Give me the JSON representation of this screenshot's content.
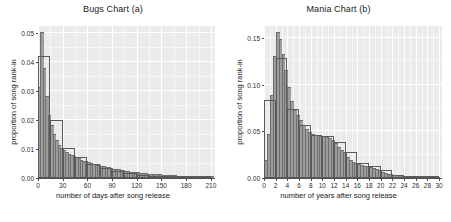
{
  "figure": {
    "background": "#ffffff",
    "panel_background": "#ebebeb",
    "gridline_color": "#ffffff",
    "bar_fill": "#9c9c9c",
    "bar_outline": "#5a5a5a"
  },
  "chart_data": [
    {
      "type": "bar",
      "id": "bugs",
      "title": "Bugs Chart (a)",
      "xlabel": "number of days after song release",
      "ylabel": "proportion of song rank-in",
      "xlim": [
        0,
        215
      ],
      "ylim": [
        0,
        0.0525
      ],
      "xticks": [
        0,
        30,
        60,
        90,
        120,
        150,
        180,
        210
      ],
      "xticklabels": [
        "0",
        "30",
        "60",
        "90",
        "120",
        "150",
        "180",
        "210"
      ],
      "yticks": [
        0.0,
        0.01,
        0.02,
        0.03,
        0.04,
        0.05
      ],
      "yticklabels": [
        "0.00",
        "0.01",
        "0.02",
        "0.03",
        "0.04",
        "0.05"
      ],
      "grid": true,
      "legend": "none",
      "series": [
        {
          "name": "fine-bin histogram",
          "style": "filled",
          "bin_width": 3,
          "bin_starts": [
            0,
            3,
            6,
            9,
            12,
            15,
            18,
            21,
            24,
            27,
            30,
            33,
            36,
            39,
            42,
            45,
            48,
            51,
            54,
            57,
            60,
            63,
            66,
            69,
            72,
            75,
            78,
            81,
            84,
            87,
            90,
            93,
            96,
            99,
            102,
            105,
            108,
            111,
            114,
            117,
            120,
            123,
            126,
            129,
            132,
            135,
            138,
            141,
            144,
            147,
            150,
            153,
            156,
            159,
            162,
            165,
            168,
            171,
            174,
            177,
            180,
            183,
            186,
            189,
            192,
            195,
            198,
            201,
            204,
            207,
            210
          ],
          "values": [
            0.031,
            0.05,
            0.0375,
            0.028,
            0.0215,
            0.018,
            0.015,
            0.0128,
            0.0112,
            0.01,
            0.0092,
            0.0086,
            0.0081,
            0.0076,
            0.0072,
            0.0068,
            0.0064,
            0.006,
            0.0057,
            0.0054,
            0.0051,
            0.0048,
            0.0046,
            0.0043,
            0.0041,
            0.0039,
            0.0037,
            0.0035,
            0.0033,
            0.0031,
            0.0029,
            0.0028,
            0.0026,
            0.0025,
            0.0023,
            0.0022,
            0.0021,
            0.0019,
            0.0018,
            0.0017,
            0.0016,
            0.0015,
            0.0014,
            0.0013,
            0.0012,
            0.0011,
            0.0011,
            0.001,
            0.0009,
            0.0009,
            0.0008,
            0.0008,
            0.0007,
            0.0007,
            0.0006,
            0.0006,
            0.0005,
            0.0005,
            0.0005,
            0.0004,
            0.0004,
            0.0004,
            0.0003,
            0.0003,
            0.0003,
            0.0003,
            0.0002,
            0.0002,
            0.0002,
            0.0002,
            0.0002
          ]
        },
        {
          "name": "wide-bin histogram outline",
          "style": "outline",
          "bin_width": 15,
          "bin_starts": [
            0,
            15,
            30,
            45,
            60,
            75,
            90,
            105,
            120,
            135,
            150,
            165,
            180,
            195
          ],
          "values": [
            0.042,
            0.02,
            0.0105,
            0.0072,
            0.005,
            0.0035,
            0.0024,
            0.0016,
            0.0011,
            0.0008,
            0.0006,
            0.0004,
            0.0003,
            0.0002
          ]
        }
      ]
    },
    {
      "type": "bar",
      "id": "mania",
      "title": "Mania Chart (b)",
      "xlabel": "number of years after song release",
      "ylabel": "proportion of song rank-in",
      "xlim": [
        0,
        30.5
      ],
      "ylim": [
        0,
        0.163
      ],
      "xticks": [
        0,
        2,
        4,
        6,
        8,
        10,
        12,
        14,
        16,
        18,
        20,
        22,
        24,
        26,
        28,
        30
      ],
      "xticklabels": [
        "0",
        "2",
        "4",
        "6",
        "8",
        "10",
        "12",
        "14",
        "16",
        "18",
        "20",
        "22",
        "24",
        "26",
        "28",
        "30"
      ],
      "yticks": [
        0.0,
        0.05,
        0.1,
        0.15
      ],
      "yticklabels": [
        "0.00",
        "0.05",
        "0.10",
        "0.15"
      ],
      "grid": true,
      "legend": "none",
      "series": [
        {
          "name": "fine-bin histogram",
          "style": "filled",
          "bin_width": 0.5,
          "bin_starts": [
            0,
            0.5,
            1,
            1.5,
            2,
            2.5,
            3,
            3.5,
            4,
            4.5,
            5,
            5.5,
            6,
            6.5,
            7,
            7.5,
            8,
            8.5,
            9,
            9.5,
            10,
            10.5,
            11,
            11.5,
            12,
            12.5,
            13,
            13.5,
            14,
            14.5,
            15,
            15.5,
            16,
            16.5,
            17,
            17.5,
            18,
            18.5,
            19,
            19.5,
            20,
            20.5,
            21,
            21.5,
            22,
            22.5,
            23,
            23.5,
            24,
            24.5,
            25,
            25.5,
            26,
            26.5,
            27,
            27.5,
            28,
            28.5,
            29,
            29.5
          ],
          "values": [
            0.018,
            0.046,
            0.088,
            0.13,
            0.156,
            0.148,
            0.132,
            0.115,
            0.096,
            0.081,
            0.072,
            0.066,
            0.061,
            0.056,
            0.051,
            0.048,
            0.046,
            0.045,
            0.0448,
            0.0445,
            0.044,
            0.043,
            0.0415,
            0.0395,
            0.036,
            0.0325,
            0.0295,
            0.027,
            0.0215,
            0.0185,
            0.0165,
            0.015,
            0.014,
            0.013,
            0.0122,
            0.0115,
            0.0108,
            0.01,
            0.0085,
            0.007,
            0.0055,
            0.0042,
            0.0034,
            0.0028,
            0.0024,
            0.0021,
            0.0018,
            0.0016,
            0.0014,
            0.0012,
            0.001,
            0.0009,
            0.0008,
            0.0007,
            0.0006,
            0.0005,
            0.0004,
            0.0004,
            0.0003,
            0.0003
          ]
        },
        {
          "name": "wide-bin histogram outline",
          "style": "outline",
          "bin_width": 2,
          "bin_starts": [
            0,
            2,
            4,
            6,
            8,
            10,
            12,
            14,
            16,
            18,
            20,
            22,
            24,
            26,
            28
          ],
          "values": [
            0.084,
            0.1285,
            0.0735,
            0.0565,
            0.046,
            0.0455,
            0.039,
            0.0275,
            0.016,
            0.013,
            0.009,
            0.0035,
            0.002,
            0.001,
            0.0005
          ]
        }
      ]
    }
  ]
}
